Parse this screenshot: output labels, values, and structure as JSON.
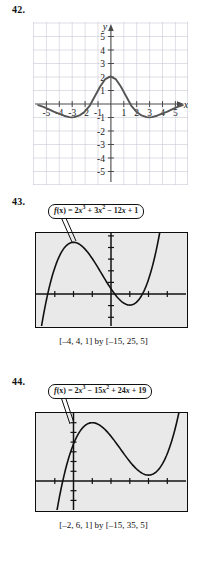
{
  "page": {
    "background_color": "#ffffff",
    "ink_color": "#1a1a1a"
  },
  "problems": [
    {
      "number": "42.",
      "kind": "coordinate-grid-graph",
      "axis_labels": {
        "x": "x",
        "y": "y"
      },
      "x_ticks": [
        "-5",
        "-4",
        "-3",
        "-2",
        "-1",
        "1",
        "2",
        "3",
        "4",
        "5"
      ],
      "y_ticks": [
        "5",
        "4",
        "3",
        "2",
        "1",
        "-1",
        "-2",
        "-3",
        "-4",
        "-5"
      ],
      "grid_color": "#c9c9d6",
      "curve_color": "#555555",
      "chart_data": {
        "type": "line",
        "title": "",
        "xlabel": "x",
        "ylabel": "y",
        "xlim": [
          -6,
          6
        ],
        "ylim": [
          -6,
          6
        ],
        "grid": true,
        "legend": "none",
        "x_ticks": [
          -5,
          -4,
          -3,
          -2,
          -1,
          1,
          2,
          3,
          4,
          5
        ],
        "y_ticks": [
          5,
          4,
          3,
          2,
          1,
          -1,
          -2,
          -3,
          -4,
          -5
        ],
        "series": [
          {
            "name": "damped oscillation",
            "x": [
              -5.6,
              -5.2,
              -4.8,
              -4.4,
              -4.0,
              -3.6,
              -3.2,
              -3.0,
              -2.8,
              -2.4,
              -2.0,
              -1.6,
              -1.2,
              -0.8,
              -0.4,
              0.0,
              0.4,
              0.8,
              1.2,
              1.6,
              2.0,
              2.4,
              2.8,
              3.0,
              3.2,
              3.6,
              4.0,
              4.4,
              4.8,
              5.2,
              5.6
            ],
            "y": [
              -0.12,
              -0.25,
              -0.42,
              -0.6,
              -0.75,
              -0.9,
              -1.0,
              -1.02,
              -1.0,
              -0.88,
              -0.6,
              -0.15,
              0.55,
              1.25,
              1.8,
              2.0,
              1.8,
              1.25,
              0.55,
              -0.15,
              -0.6,
              -0.88,
              -1.0,
              -1.02,
              -1.0,
              -0.9,
              -0.75,
              -0.6,
              -0.42,
              -0.25,
              -0.12
            ]
          }
        ]
      }
    },
    {
      "number": "43.",
      "kind": "graphing-calculator-screen",
      "callout": {
        "prefix": "f",
        "arg": "(x)",
        "equals": " = ",
        "expression_plain": "2x3 + 3x2 - 12x + 1",
        "terms": [
          {
            "coef": "2",
            "var": "x",
            "exp": "3"
          },
          {
            "op": " + ",
            "coef": "3",
            "var": "x",
            "exp": "2"
          },
          {
            "op": " − ",
            "coef": "12",
            "var": "x",
            "exp": ""
          },
          {
            "op": " + ",
            "coef": "1",
            "var": "",
            "exp": ""
          }
        ]
      },
      "caption": "[–4, 4, 1] by [–15, 25, 5]",
      "screen_background": "#e9e9e9",
      "chart_data": {
        "type": "line",
        "title": "f(x) = 2x³ + 3x² − 12x + 1",
        "xlabel": "",
        "ylabel": "",
        "xlim": [
          -4,
          4
        ],
        "ylim": [
          -15,
          25
        ],
        "xscale": 1,
        "yscale": 5,
        "grid": false,
        "legend": "none",
        "function": "2*x^3 + 3*x^2 - 12*x + 1",
        "local_max": {
          "x": -2,
          "y": 21
        },
        "local_min": {
          "x": 1,
          "y": -6
        },
        "x": [
          -4.0,
          -3.75,
          -3.5,
          -3.25,
          -3.0,
          -2.75,
          -2.5,
          -2.25,
          -2.0,
          -1.75,
          -1.5,
          -1.25,
          -1.0,
          -0.75,
          -0.5,
          -0.25,
          0.0,
          0.25,
          0.5,
          0.75,
          1.0,
          1.25,
          1.5,
          1.75,
          2.0,
          2.25,
          2.5,
          2.75,
          3.0
        ],
        "y": [
          -31.0,
          -21.3,
          -13.3,
          -6.8,
          -1.7,
          2.2,
          4.0,
          5.3,
          5.0,
          4.2,
          2.8,
          1.1,
          -1.0,
          -3.2,
          -5.5,
          -7.7,
          -9.8,
          -11.7,
          -13.2,
          -14.4,
          -15.0,
          -14.9,
          -14.0,
          -12.1,
          -9.1,
          -4.9,
          0.7,
          7.9,
          16.8
        ]
      }
    },
    {
      "number": "44.",
      "kind": "graphing-calculator-screen",
      "callout": {
        "prefix": "f",
        "arg": "(x)",
        "equals": " = ",
        "expression_plain": "2x3 - 15x2 + 24x + 19",
        "terms": [
          {
            "coef": "2",
            "var": "x",
            "exp": "3"
          },
          {
            "op": " − ",
            "coef": "15",
            "var": "x",
            "exp": "2"
          },
          {
            "op": " + ",
            "coef": "24",
            "var": "x",
            "exp": ""
          },
          {
            "op": " + ",
            "coef": "19",
            "var": "",
            "exp": ""
          }
        ]
      },
      "caption": "[–2, 6, 1] by [–15, 35, 5]",
      "screen_background": "#e9e9e9",
      "chart_data": {
        "type": "line",
        "title": "f(x) = 2x³ − 15x² + 24x + 19",
        "xlabel": "",
        "ylabel": "",
        "xlim": [
          -2,
          6
        ],
        "ylim": [
          -15,
          35
        ],
        "xscale": 1,
        "yscale": 5,
        "grid": false,
        "legend": "none",
        "function": "2*x^3 - 15*x^2 + 24*x + 19",
        "local_max": {
          "x": 1,
          "y": 30
        },
        "local_min": {
          "x": 4,
          "y": 3
        },
        "x": [
          -1.6,
          -1.4,
          -1.2,
          -1.0,
          -0.8,
          -0.6,
          -0.4,
          -0.2,
          0.0,
          0.25,
          0.5,
          0.75,
          1.0,
          1.25,
          1.5,
          1.75,
          2.0,
          2.5,
          3.0,
          3.5,
          4.0,
          4.5,
          5.0,
          5.5,
          5.9
        ],
        "y": [
          -27.6,
          -19.1,
          -11.3,
          -4.3,
          2.1,
          7.8,
          12.8,
          17.2,
          19.0,
          24.1,
          27.5,
          29.4,
          30.0,
          29.5,
          28.0,
          25.8,
          23.0,
          16.5,
          10.0,
          4.5,
          3.0,
          4.5,
          14.0,
          28.5,
          44.9
        ]
      }
    }
  ]
}
